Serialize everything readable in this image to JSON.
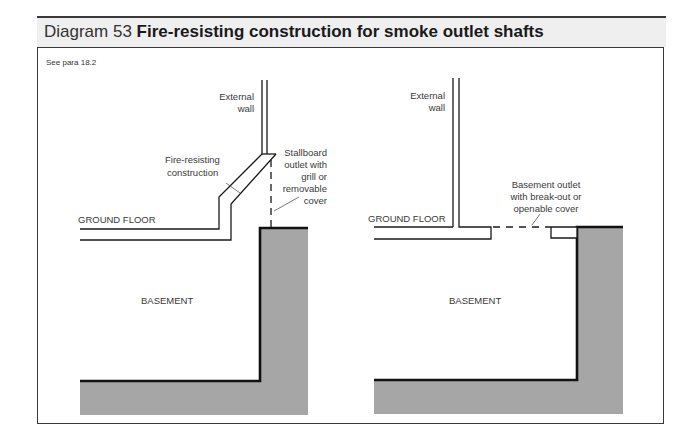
{
  "header": {
    "prefix": "Diagram 53",
    "title": "Fire-resisting construction for smoke outlet shafts"
  },
  "reference": "See para 18.2",
  "colors": {
    "line": "#1a1a1a",
    "fill_ground": "#a6a6a6",
    "header_band": "#efefef",
    "label": "#3a3a3a"
  },
  "left_diagram": {
    "labels": {
      "external_wall_1": "External",
      "external_wall_2": "wall",
      "fire_resisting_1": "Fire-resisting",
      "fire_resisting_2": "construction",
      "stallboard_1": "Stallboard",
      "stallboard_2": "outlet with",
      "stallboard_3": "grill or",
      "stallboard_4": "removable",
      "stallboard_5": "cover",
      "ground_floor": "GROUND FLOOR",
      "basement": "BASEMENT"
    }
  },
  "right_diagram": {
    "labels": {
      "external_wall_1": "External",
      "external_wall_2": "wall",
      "basement_outlet_1": "Basement outlet",
      "basement_outlet_2": "with break-out or",
      "basement_outlet_3": "openable cover",
      "ground_floor": "GROUND FLOOR",
      "basement": "BASEMENT"
    }
  }
}
